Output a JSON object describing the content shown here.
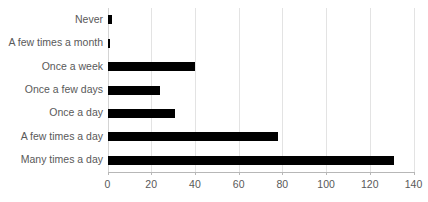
{
  "chart_data": {
    "type": "bar",
    "orientation": "horizontal",
    "title": "",
    "subtitle": "",
    "xlabel": "",
    "ylabel": "",
    "categories": [
      "Never",
      "A few times a month",
      "Once a week",
      "Once a few days",
      "Once a day",
      "A few times a day",
      "Many times a day"
    ],
    "values": [
      2,
      1,
      40,
      24,
      31,
      78,
      131
    ],
    "xlim": [
      0,
      140
    ],
    "xticks": [
      0,
      20,
      40,
      60,
      80,
      100,
      120,
      140
    ],
    "xtick_labels": [
      "0",
      "20",
      "40",
      "60",
      "80",
      "100",
      "120",
      "140"
    ],
    "grid": "vertical",
    "legend": "none",
    "bar_color": "#000000",
    "gridline_color": "#E3E3E3",
    "axis_color": "#B7B7B7",
    "label_color": "#595959"
  }
}
